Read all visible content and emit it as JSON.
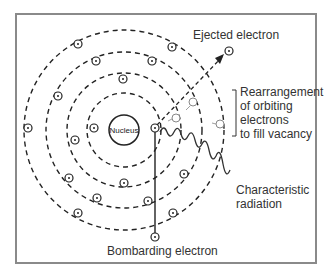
{
  "labels": {
    "nucleus": "Nucleus",
    "ejected": "Ejected electron",
    "rearrangement": [
      "Rearrangement",
      "of orbiting",
      "electrons",
      "to fill vacancy"
    ],
    "characteristic": [
      "Characteristic",
      "radiation"
    ],
    "bombarding": "Bombarding electron"
  },
  "colors": {
    "line": "#222222",
    "frame": "#8a8a8a",
    "faded": "#888888"
  }
}
